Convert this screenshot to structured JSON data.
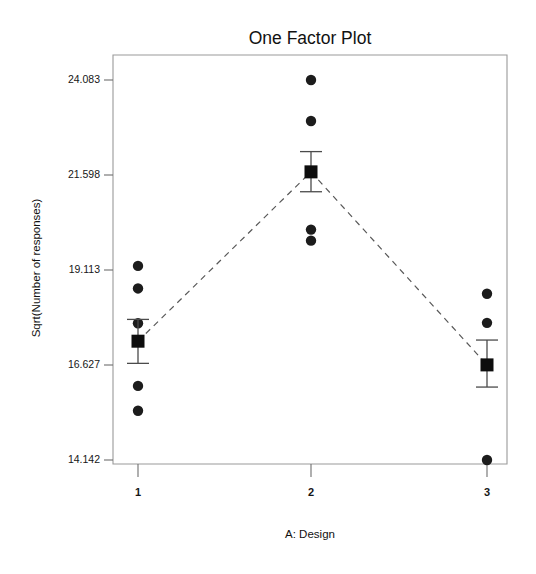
{
  "chart_data": {
    "type": "scatter",
    "title": "One Factor Plot",
    "xlabel": "A: Design",
    "ylabel": "Sqrt(Number of responses)",
    "categories": [
      "1",
      "2",
      "3"
    ],
    "ytick_labels": [
      "24.083",
      "21.598",
      "19.113",
      "16.627",
      "14.142"
    ],
    "ytick_values": [
      24.083,
      21.598,
      19.113,
      16.627,
      14.142
    ],
    "ylim": [
      13.35,
      24.8
    ],
    "grid": false,
    "legend": false,
    "series": [
      {
        "name": "Design 1",
        "category": "1",
        "points": [
          19.22,
          18.63,
          17.72,
          16.08,
          15.43
        ],
        "mean": 17.25,
        "err_upper": 17.82,
        "err_lower": 16.67
      },
      {
        "name": "Design 2",
        "category": "2",
        "points": [
          24.083,
          23.01,
          20.17,
          19.88
        ],
        "mean": 21.68,
        "err_upper": 22.21,
        "err_lower": 21.16
      },
      {
        "name": "Design 3",
        "category": "3",
        "points": [
          18.49,
          17.73,
          14.142
        ],
        "mean": 16.63,
        "err_upper": 17.28,
        "err_lower": 16.05
      }
    ],
    "mean_connector": [
      17.25,
      21.68,
      16.63
    ],
    "marker_style": "filled-circle",
    "mean_marker_style": "filled-square",
    "connector_style": "dashed"
  },
  "labels": {
    "title": "One Factor Plot",
    "x_axis_title": "A: Design",
    "y_axis_title": "Sqrt(Number of responses)",
    "x_tick_1": "1",
    "x_tick_2": "2",
    "x_tick_3": "3",
    "y_tick_1": "24.083",
    "y_tick_2": "21.598",
    "y_tick_3": "19.113",
    "y_tick_4": "16.627",
    "y_tick_5": "14.142"
  },
  "colors": {
    "point": "#1c1c1c",
    "mean": "#0d0d0d",
    "error_bar": "#4b4b4b",
    "connector": "#585858",
    "frame": "#9a9a9a",
    "background": "#ffffff"
  }
}
